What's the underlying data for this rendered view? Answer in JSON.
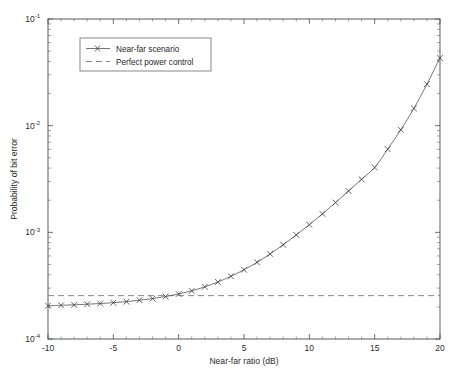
{
  "figure": {
    "background_color": "#ffffff",
    "axis_color": "#4a4a4a"
  },
  "chart_data": {
    "type": "line",
    "title": "",
    "xlabel": "Near-far ratio (dB)",
    "ylabel": "Probability of bit error",
    "xlim": [
      -10,
      20
    ],
    "ylim": [
      0.0001,
      0.1
    ],
    "yscale": "log",
    "xscale": "linear",
    "grid": false,
    "legend_position": "upper left",
    "xticks": [
      -10,
      -5,
      0,
      5,
      10,
      15,
      20
    ],
    "xtick_labels": [
      "-10",
      "-5",
      "0",
      "5",
      "10",
      "15",
      "20"
    ],
    "yticks": [
      0.0001,
      0.001,
      0.01,
      0.1
    ],
    "ytick_labels": [
      "10-4",
      "10-3",
      "10-2",
      "10-1"
    ],
    "ytick_mantissas": [
      "10",
      "10",
      "10",
      "10"
    ],
    "ytick_exponents": [
      "-4",
      "-3",
      "-2",
      "-1"
    ],
    "x": [
      -10,
      -9,
      -8,
      -7,
      -6,
      -5,
      -4,
      -3,
      -2,
      -1,
      0,
      1,
      2,
      3,
      4,
      5,
      6,
      7,
      8,
      9,
      10,
      11,
      12,
      13,
      14,
      15,
      16,
      17,
      18,
      19,
      20
    ],
    "series": [
      {
        "name": "Near-far scenario",
        "marker": "x",
        "linestyle": "solid",
        "color": "#5d5d5d",
        "values": [
          0.000205,
          0.000207,
          0.000209,
          0.000212,
          0.000215,
          0.000219,
          0.000224,
          0.000231,
          0.000239,
          0.00025,
          0.000264,
          0.000283,
          0.000308,
          0.000342,
          0.000387,
          0.000446,
          0.000524,
          0.000628,
          0.000765,
          0.000945,
          0.00118,
          0.00149,
          0.0019,
          0.00244,
          0.00314,
          0.00406,
          0.00602,
          0.00916,
          0.0145,
          0.0245,
          0.0432
        ]
      },
      {
        "name": "Perfect power control",
        "marker": "none",
        "linestyle": "dashed",
        "color": "#7a7a7a",
        "constant_value": 0.000255
      }
    ]
  },
  "legend": {
    "entries": [
      {
        "label": "Near-far scenario",
        "marker": "x",
        "linestyle": "solid"
      },
      {
        "label": "Perfect power control",
        "marker": "none",
        "linestyle": "dashed"
      }
    ]
  }
}
